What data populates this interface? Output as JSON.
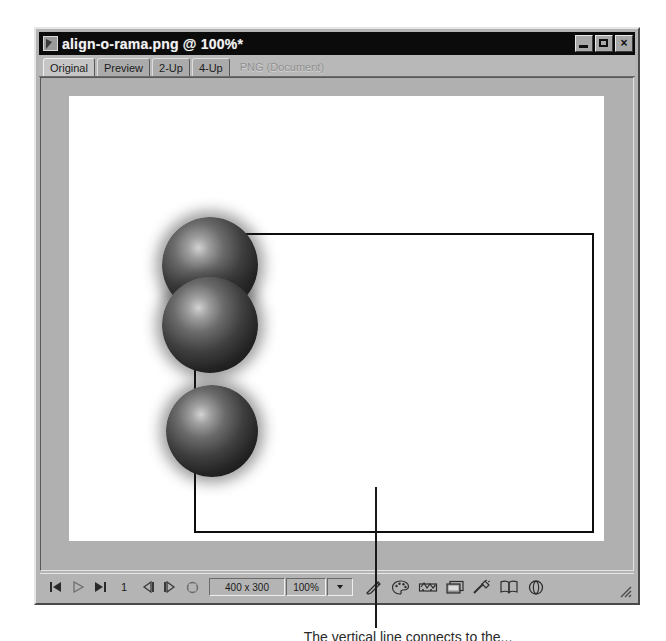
{
  "window": {
    "title": "align-o-rama.png @  100%*",
    "icon": "document-image-icon",
    "caption_buttons": [
      {
        "name": "minimize",
        "label": ""
      },
      {
        "name": "maximize",
        "label": ""
      },
      {
        "name": "close",
        "label": "×"
      }
    ]
  },
  "tabs": [
    {
      "label": "Original",
      "active": true
    },
    {
      "label": "Preview",
      "active": false
    },
    {
      "label": "2-Up",
      "active": false
    },
    {
      "label": "4-Up",
      "active": false
    }
  ],
  "document_type_label": "PNG (Document)",
  "canvas": {
    "artwork_width_px": 400,
    "artwork_height_px": 300,
    "spheres": [
      {
        "name": "sphere-top",
        "left": -34,
        "top": -18,
        "size": 96
      },
      {
        "name": "sphere-middle",
        "left": -34,
        "top": 42,
        "size": 96
      },
      {
        "name": "sphere-bottom",
        "left": -30,
        "top": 150,
        "size": 92
      }
    ]
  },
  "status_bar": {
    "first_frame_label": "first-frame",
    "play_label": "play",
    "last_frame_label": "last-frame",
    "frame_number": "1",
    "previous_frame_label": "previous-frame",
    "next_frame_label": "next-frame",
    "loop_label": "loop-playback",
    "image_size": "400 x 300",
    "zoom_level": "100%",
    "tools": [
      {
        "name": "pencil-icon",
        "label": "Pencil"
      },
      {
        "name": "palette-icon",
        "label": "Color Palette"
      },
      {
        "name": "animation-icon",
        "label": "Animation"
      },
      {
        "name": "preview-in-browser-icon",
        "label": "Preview in Browser"
      },
      {
        "name": "optimize-icon",
        "label": "Optimize"
      },
      {
        "name": "book-icon",
        "label": "Library"
      },
      {
        "name": "rotate-icon",
        "label": "Rotate"
      }
    ]
  },
  "annotation": {
    "caption": "The vertical line connects to the...",
    "line_color": "#1a1a1a"
  },
  "colors": {
    "window_face": "#b4b4b4",
    "titlebar": "#0b0b0b",
    "titlebar_text": "#f2f2f2",
    "work_area": "#b0b0b0",
    "document_sheet": "#ffffff",
    "artwork_border": "#0d0d0d",
    "disabled_text": "#8f8f8f"
  }
}
